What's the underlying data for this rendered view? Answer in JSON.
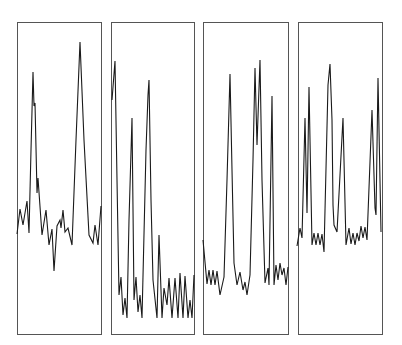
{
  "chart_data": {
    "type": "line",
    "title": "",
    "xlabel": "",
    "ylabel": "",
    "grid": false,
    "legend": null,
    "panels": [
      {
        "name": "panel-1",
        "frame": {
          "x": 17,
          "y": 22,
          "width": 84,
          "height": 312
        },
        "points": [
          [
            17,
            234
          ],
          [
            20,
            209
          ],
          [
            23,
            225
          ],
          [
            27,
            201
          ],
          [
            29,
            233
          ],
          [
            31,
            150
          ],
          [
            33,
            72
          ],
          [
            34,
            106
          ],
          [
            35,
            103
          ],
          [
            37,
            193
          ],
          [
            38,
            178
          ],
          [
            42,
            235
          ],
          [
            46,
            210
          ],
          [
            49,
            245
          ],
          [
            52,
            229
          ],
          [
            54,
            271
          ],
          [
            57,
            226
          ],
          [
            60,
            220
          ],
          [
            61,
            228
          ],
          [
            63,
            210
          ],
          [
            65,
            232
          ],
          [
            68,
            228
          ],
          [
            72,
            245
          ],
          [
            76,
            140
          ],
          [
            80,
            42
          ],
          [
            84,
            140
          ],
          [
            89,
            235
          ],
          [
            93,
            243
          ],
          [
            95,
            225
          ],
          [
            98,
            245
          ],
          [
            101,
            206
          ]
        ]
      },
      {
        "name": "panel-2",
        "frame": {
          "x": 111,
          "y": 22,
          "width": 83,
          "height": 312
        },
        "points": [
          [
            112,
            100
          ],
          [
            115,
            61
          ],
          [
            117,
            180
          ],
          [
            119,
            295
          ],
          [
            121,
            277
          ],
          [
            123,
            315
          ],
          [
            125,
            298
          ],
          [
            127,
            318
          ],
          [
            129,
            220
          ],
          [
            132,
            118
          ],
          [
            134,
            300
          ],
          [
            136,
            277
          ],
          [
            138,
            312
          ],
          [
            140,
            295
          ],
          [
            142,
            318
          ],
          [
            146,
            150
          ],
          [
            148,
            95
          ],
          [
            149,
            80
          ],
          [
            151,
            200
          ],
          [
            153,
            280
          ],
          [
            157,
            318
          ],
          [
            159,
            235
          ],
          [
            162,
            318
          ],
          [
            164,
            288
          ],
          [
            167,
            305
          ],
          [
            169,
            278
          ],
          [
            172,
            318
          ],
          [
            175,
            278
          ],
          [
            178,
            318
          ],
          [
            180,
            273
          ],
          [
            183,
            318
          ],
          [
            185,
            276
          ],
          [
            188,
            318
          ],
          [
            190,
            300
          ],
          [
            192,
            318
          ],
          [
            194,
            275
          ]
        ]
      },
      {
        "name": "panel-3",
        "frame": {
          "x": 203,
          "y": 22,
          "width": 85,
          "height": 312
        },
        "points": [
          [
            203,
            240
          ],
          [
            207,
            284
          ],
          [
            209,
            270
          ],
          [
            211,
            285
          ],
          [
            213,
            270
          ],
          [
            215,
            285
          ],
          [
            217,
            271
          ],
          [
            220,
            295
          ],
          [
            224,
            277
          ],
          [
            227,
            180
          ],
          [
            230,
            74
          ],
          [
            232,
            170
          ],
          [
            234,
            263
          ],
          [
            237,
            285
          ],
          [
            240,
            272
          ],
          [
            243,
            290
          ],
          [
            245,
            282
          ],
          [
            247,
            295
          ],
          [
            250,
            275
          ],
          [
            253,
            160
          ],
          [
            255,
            68
          ],
          [
            257,
            145
          ],
          [
            260,
            60
          ],
          [
            262,
            180
          ],
          [
            265,
            283
          ],
          [
            268,
            268
          ],
          [
            269,
            285
          ],
          [
            272,
            96
          ],
          [
            274,
            285
          ],
          [
            276,
            265
          ],
          [
            278,
            280
          ],
          [
            280,
            263
          ],
          [
            282,
            275
          ],
          [
            284,
            268
          ],
          [
            286,
            285
          ],
          [
            288,
            267
          ]
        ]
      },
      {
        "name": "panel-4",
        "frame": {
          "x": 298,
          "y": 22,
          "width": 84,
          "height": 312
        },
        "points": [
          [
            297,
            246
          ],
          [
            300,
            228
          ],
          [
            302,
            238
          ],
          [
            305,
            118
          ],
          [
            307,
            213
          ],
          [
            309,
            87
          ],
          [
            312,
            245
          ],
          [
            314,
            233
          ],
          [
            316,
            245
          ],
          [
            318,
            233
          ],
          [
            320,
            245
          ],
          [
            322,
            234
          ],
          [
            324,
            252
          ],
          [
            328,
            85
          ],
          [
            330,
            64
          ],
          [
            332,
            120
          ],
          [
            333,
            205
          ],
          [
            334,
            225
          ],
          [
            337,
            232
          ],
          [
            343,
            118
          ],
          [
            346,
            245
          ],
          [
            349,
            228
          ],
          [
            351,
            244
          ],
          [
            353,
            233
          ],
          [
            355,
            245
          ],
          [
            357,
            233
          ],
          [
            359,
            241
          ],
          [
            361,
            226
          ],
          [
            363,
            238
          ],
          [
            365,
            227
          ],
          [
            367,
            240
          ],
          [
            372,
            110
          ],
          [
            375,
            208
          ],
          [
            376,
            215
          ],
          [
            378,
            78
          ],
          [
            381,
            232
          ]
        ]
      }
    ]
  },
  "colors": {
    "background": "#ffffff",
    "frame": "#555555",
    "trace": "#1a1a1a"
  }
}
